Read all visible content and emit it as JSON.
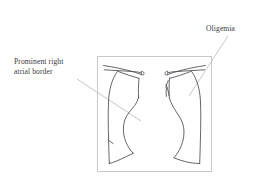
{
  "figure": {
    "type": "medical-line-illustration",
    "background_color": "#ffffff",
    "frame": {
      "name": "radiograph-frame",
      "color": "#c9c9cc",
      "x": 97,
      "y": 56,
      "width": 115,
      "height": 116
    },
    "drawing": {
      "stroke_color": "#4a4a52",
      "leader_color": "#b8b8bd",
      "parts": [
        "left-clavicle",
        "right-clavicle",
        "left-lung-border",
        "right-lung-border",
        "cardiac-silhouette",
        "right-atrial-border",
        "mediastinum",
        "left-hemidiaphragm",
        "right-hemidiaphragm"
      ]
    }
  },
  "annotations": [
    {
      "id": "right-atrial-border",
      "line1": "Prominent right",
      "line2": "atrial border",
      "leader": {
        "x1": 77,
        "y1": 79,
        "x2": 141,
        "y2": 121
      }
    },
    {
      "id": "oligemia",
      "line1": "Oligemia",
      "line2": "",
      "leader": {
        "x1": 228,
        "y1": 36,
        "x2": 189,
        "y2": 96
      }
    }
  ],
  "colors": {
    "text": "#3a3a42",
    "stroke": "#4a4a52",
    "leader": "#b8b8bd",
    "frame": "#c9c9cc",
    "background": "#ffffff"
  }
}
